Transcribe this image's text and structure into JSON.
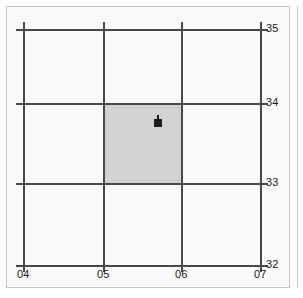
{
  "figure": {
    "type": "coordinate-grid-map",
    "background_color": "#fafafa",
    "grid_line_color": "#4a4a4a",
    "highlight_color": "#d2d2d2",
    "marker_color": "#1b1b1b"
  },
  "axes": {
    "x": {
      "ticks": [
        {
          "label": "04",
          "px": 23
        },
        {
          "label": "05",
          "px": 103
        },
        {
          "label": "06",
          "px": 181
        },
        {
          "label": "07",
          "px": 260
        }
      ]
    },
    "y": {
      "ticks": [
        {
          "label": "35",
          "px": 29
        },
        {
          "label": "34",
          "px": 103
        },
        {
          "label": "33",
          "px": 183
        },
        {
          "label": "32",
          "px": 265
        }
      ]
    }
  },
  "highlight": {
    "name": "highlighted-grid-square",
    "x_range": [
      "05",
      "06"
    ],
    "y_range": [
      "33",
      "34"
    ]
  },
  "marker": {
    "name": "site-marker",
    "x": "05.7",
    "y": "33.8"
  }
}
